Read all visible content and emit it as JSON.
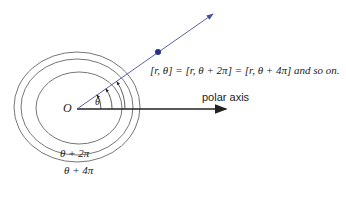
{
  "diagram": {
    "equation_text": "[r, θ] = [r, θ + 2π] = [r, θ + 4π] and so on.",
    "polar_axis_label": "polar axis",
    "origin_label": "O",
    "theta_label": "θ",
    "circle_labels": [
      "θ + 2π",
      "θ + 4π"
    ],
    "colors": {
      "ray": "#4a4f9a",
      "point": "#2a2f8a",
      "circles": "#555555",
      "axis": "#222222"
    }
  }
}
